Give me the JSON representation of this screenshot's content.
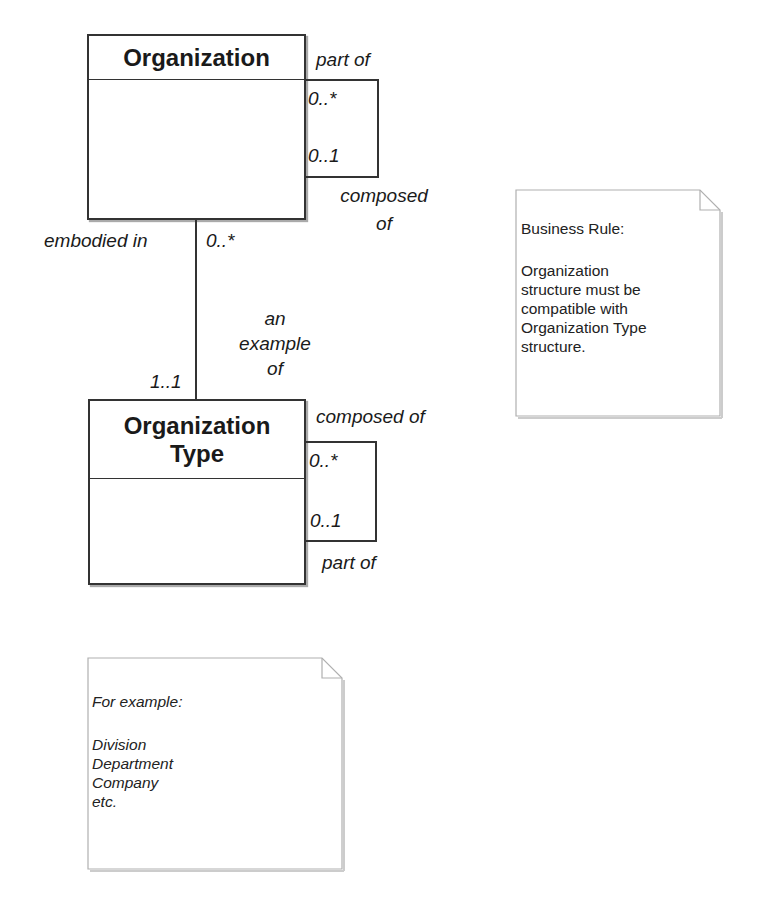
{
  "classes": {
    "organization": {
      "name": "Organization"
    },
    "organization_type": {
      "name_line1": "Organization",
      "name_line2": "Type"
    }
  },
  "associations": {
    "org_self": {
      "top_role": "part of",
      "top_multiplicity": "0..*",
      "bottom_multiplicity": "0..1",
      "bottom_role_line1": "composed",
      "bottom_role_line2": "of"
    },
    "org_to_type": {
      "org_role": "embodied in",
      "org_multiplicity": "0..*",
      "type_role_line1": "an",
      "type_role_line2": "example",
      "type_role_line3": "of",
      "type_multiplicity": "1..1"
    },
    "type_self": {
      "top_role": "composed of",
      "top_multiplicity": "0..*",
      "bottom_multiplicity": "0..1",
      "bottom_role": "part of"
    }
  },
  "notes": {
    "business_rule": {
      "title": "Business Rule:",
      "body": "Organization\nstructure must be\ncompatible with\nOrganization Type\nstructure."
    },
    "examples": {
      "title": "For example:",
      "body": "Division\nDepartment\nCompany\netc."
    }
  },
  "colors": {
    "line": "#333333",
    "note_border": "#b0b0b0",
    "text": "#1a1a1a"
  }
}
